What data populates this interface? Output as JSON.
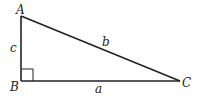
{
  "diagram": {
    "type": "right-triangle",
    "vertices": {
      "A": {
        "label": "A",
        "x": 21,
        "y": 16
      },
      "B": {
        "label": "B",
        "x": 21,
        "y": 81
      },
      "C": {
        "label": "C",
        "x": 180,
        "y": 81
      }
    },
    "sides": {
      "a": {
        "label": "a",
        "between": [
          "B",
          "C"
        ]
      },
      "b": {
        "label": "b",
        "between": [
          "A",
          "C"
        ]
      },
      "c": {
        "label": "c",
        "between": [
          "A",
          "B"
        ]
      }
    },
    "right_angle_at": "B",
    "colors": {
      "stroke": "#222222",
      "background": "#ffffff"
    }
  }
}
